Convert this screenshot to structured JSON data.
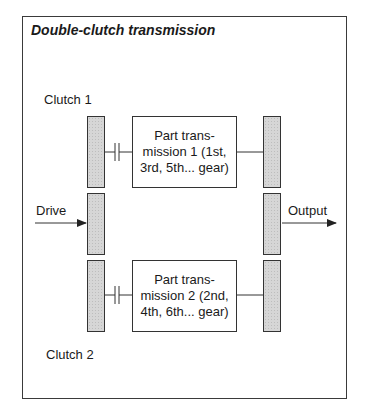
{
  "title": "Double-clutch transmission",
  "labels": {
    "clutch1": "Clutch 1",
    "clutch2": "Clutch 2",
    "drive": "Drive",
    "output": "Output"
  },
  "boxes": [
    {
      "lines": [
        "Part trans-",
        "mission 1 (1st,",
        "3rd, 5th... gear)"
      ]
    },
    {
      "lines": [
        "Part trans-",
        "mission 2 (2nd,",
        "4th, 6th... gear)"
      ]
    }
  ],
  "colors": {
    "stroke": "#333333",
    "bar_fill": "#d6d6d6"
  }
}
